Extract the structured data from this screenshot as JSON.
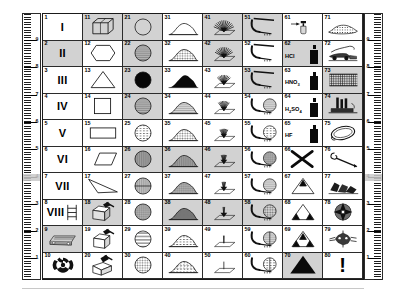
{
  "rulers": {
    "left": {
      "name": "left-ruler",
      "labels": [
        "9",
        "8",
        "7",
        "6",
        "5",
        "4",
        "3",
        "2",
        "1"
      ],
      "highlight_at": "4"
    },
    "right": {
      "name": "right-ruler",
      "labels": [
        "9",
        "8",
        "7",
        "6",
        "5",
        "4",
        "3",
        "2",
        "1"
      ],
      "highlight_at": "4"
    }
  },
  "grid": {
    "columns": 8,
    "rows": 10,
    "cells": [
      {
        "n": "1",
        "shaded": false,
        "icon": "roman-numeral-I",
        "label": "I"
      },
      {
        "n": "2",
        "shaded": true,
        "icon": "roman-numeral-II",
        "label": "II"
      },
      {
        "n": "3",
        "shaded": false,
        "icon": "roman-numeral-III",
        "label": "III"
      },
      {
        "n": "4",
        "shaded": false,
        "icon": "roman-numeral-IV",
        "label": "IV"
      },
      {
        "n": "5",
        "shaded": false,
        "icon": "roman-numeral-V",
        "label": "V"
      },
      {
        "n": "6",
        "shaded": false,
        "icon": "roman-numeral-VI",
        "label": "VI"
      },
      {
        "n": "7",
        "shaded": false,
        "icon": "roman-numeral-VII",
        "label": "VII"
      },
      {
        "n": "8",
        "shaded": false,
        "icon": "roman-numeral-VIII-ladder",
        "label": "VIII"
      },
      {
        "n": "9",
        "shaded": true,
        "icon": "scaffold-beam",
        "label": ""
      },
      {
        "n": "10",
        "shaded": false,
        "icon": "radiation-trefoil",
        "label": ""
      },
      {
        "n": "11",
        "shaded": true,
        "icon": "cube-wireframe",
        "label": ""
      },
      {
        "n": "12",
        "shaded": false,
        "icon": "hexagon-outline",
        "label": ""
      },
      {
        "n": "13",
        "shaded": false,
        "icon": "triangle-outline",
        "label": ""
      },
      {
        "n": "14",
        "shaded": false,
        "icon": "square-outline",
        "label": ""
      },
      {
        "n": "15",
        "shaded": false,
        "icon": "rectangle-outline",
        "label": ""
      },
      {
        "n": "16",
        "shaded": false,
        "icon": "parallelogram-outline",
        "label": ""
      },
      {
        "n": "17",
        "shaded": false,
        "icon": "thin-triangle-outline",
        "label": ""
      },
      {
        "n": "18",
        "shaded": true,
        "icon": "box-hammer-two",
        "label": ""
      },
      {
        "n": "19",
        "shaded": false,
        "icon": "box-hammer-one",
        "label": ""
      },
      {
        "n": "20",
        "shaded": false,
        "icon": "box-hammer-open",
        "label": ""
      },
      {
        "n": "21",
        "shaded": true,
        "icon": "circle-plain",
        "label": ""
      },
      {
        "n": "22",
        "shaded": true,
        "icon": "circle-horizontal-lines",
        "label": ""
      },
      {
        "n": "23",
        "shaded": true,
        "icon": "circle-solid-black",
        "label": ""
      },
      {
        "n": "24",
        "shaded": true,
        "icon": "circle-thin-lines",
        "label": ""
      },
      {
        "n": "25",
        "shaded": false,
        "icon": "circle-dashed-lines",
        "label": ""
      },
      {
        "n": "26",
        "shaded": true,
        "icon": "circle-vertical-lines",
        "label": ""
      },
      {
        "n": "27",
        "shaded": false,
        "icon": "circle-vert-horiz-cross",
        "label": ""
      },
      {
        "n": "28",
        "shaded": false,
        "icon": "circle-fine-grid",
        "label": ""
      },
      {
        "n": "29",
        "shaded": false,
        "icon": "circle-wide-lines",
        "label": ""
      },
      {
        "n": "30",
        "shaded": false,
        "icon": "circle-speckled",
        "label": ""
      },
      {
        "n": "31",
        "shaded": false,
        "icon": "mound-low-outline",
        "label": ""
      },
      {
        "n": "32",
        "shaded": false,
        "icon": "mound-low-shaded",
        "label": ""
      },
      {
        "n": "33",
        "shaded": false,
        "icon": "mound-solid-black",
        "label": ""
      },
      {
        "n": "34",
        "shaded": false,
        "icon": "mound-layered",
        "label": ""
      },
      {
        "n": "35",
        "shaded": false,
        "icon": "mound-speckled",
        "label": ""
      },
      {
        "n": "36",
        "shaded": true,
        "icon": "mound-vertical-hatch",
        "label": ""
      },
      {
        "n": "37",
        "shaded": false,
        "icon": "mound-cross-hatch",
        "label": ""
      },
      {
        "n": "38",
        "shaded": true,
        "icon": "mound-dense-hatch",
        "label": ""
      },
      {
        "n": "39",
        "shaded": false,
        "icon": "mound-contour-lines",
        "label": ""
      },
      {
        "n": "40",
        "shaded": false,
        "icon": "mound-rubble",
        "label": ""
      },
      {
        "n": "41",
        "shaded": true,
        "icon": "spray-fan-wide-filled",
        "label": ""
      },
      {
        "n": "42",
        "shaded": true,
        "icon": "spray-fan-wide",
        "label": ""
      },
      {
        "n": "43",
        "shaded": false,
        "icon": "spray-fan-medium",
        "label": ""
      },
      {
        "n": "44",
        "shaded": false,
        "icon": "spray-fan-narrow",
        "label": ""
      },
      {
        "n": "45",
        "shaded": false,
        "icon": "spray-fan-small",
        "label": ""
      },
      {
        "n": "46",
        "shaded": true,
        "icon": "spray-jet-tight",
        "label": ""
      },
      {
        "n": "47",
        "shaded": false,
        "icon": "spray-jet-few",
        "label": ""
      },
      {
        "n": "48",
        "shaded": true,
        "icon": "spray-jet-single",
        "label": ""
      },
      {
        "n": "49",
        "shaded": false,
        "icon": "spray-drip-pair",
        "label": ""
      },
      {
        "n": "50",
        "shaded": false,
        "icon": "spray-drip-single",
        "label": ""
      },
      {
        "n": "51",
        "shaded": true,
        "icon": "nozzle-flat-jet",
        "label": ""
      },
      {
        "n": "52",
        "shaded": false,
        "icon": "nozzle-flat-jet-2",
        "label": ""
      },
      {
        "n": "53",
        "shaded": true,
        "icon": "nozzle-flat-jet-3",
        "label": ""
      },
      {
        "n": "54",
        "shaded": false,
        "icon": "nozzle-circle-lines",
        "label": ""
      },
      {
        "n": "55",
        "shaded": false,
        "icon": "nozzle-circle-dashed",
        "label": ""
      },
      {
        "n": "56",
        "shaded": false,
        "icon": "nozzle-circle-grid",
        "label": ""
      },
      {
        "n": "57",
        "shaded": false,
        "icon": "nozzle-circle-horiz",
        "label": ""
      },
      {
        "n": "58",
        "shaded": true,
        "icon": "nozzle-circle-speckled",
        "label": ""
      },
      {
        "n": "59",
        "shaded": false,
        "icon": "nozzle-circle-cross",
        "label": ""
      },
      {
        "n": "60",
        "shaded": false,
        "icon": "nozzle-circle-quad",
        "label": ""
      },
      {
        "n": "61",
        "shaded": false,
        "icon": "spray-bottle-arrow",
        "label": ""
      },
      {
        "n": "62",
        "shaded": true,
        "icon": "chemical-bottle",
        "label": "HCl"
      },
      {
        "n": "63",
        "shaded": false,
        "icon": "chemical-bottle",
        "label": "HNO3"
      },
      {
        "n": "64",
        "shaded": false,
        "icon": "chemical-bottle",
        "label": "H2SO4"
      },
      {
        "n": "65",
        "shaded": false,
        "icon": "chemical-bottle",
        "label": "HF"
      },
      {
        "n": "66",
        "shaded": false,
        "icon": "cross-out-x",
        "label": ""
      },
      {
        "n": "67",
        "shaded": false,
        "icon": "triangle-one-small-solid",
        "label": ""
      },
      {
        "n": "68",
        "shaded": false,
        "icon": "triangle-two-solid",
        "label": ""
      },
      {
        "n": "69",
        "shaded": false,
        "icon": "triangle-three-solid",
        "label": ""
      },
      {
        "n": "70",
        "shaded": true,
        "icon": "triangle-large-solid",
        "label": ""
      },
      {
        "n": "71",
        "shaded": false,
        "icon": "gravel-bed",
        "label": ""
      },
      {
        "n": "72",
        "shaded": false,
        "icon": "machine-spreader",
        "label": ""
      },
      {
        "n": "73",
        "shaded": true,
        "icon": "hatched-field",
        "label": ""
      },
      {
        "n": "74",
        "shaded": true,
        "icon": "factory-stacks",
        "label": ""
      },
      {
        "n": "75",
        "shaded": false,
        "icon": "rope-loop",
        "label": ""
      },
      {
        "n": "76",
        "shaded": false,
        "icon": "hook-pole",
        "label": ""
      },
      {
        "n": "77",
        "shaded": false,
        "icon": "rock-fragments",
        "label": ""
      },
      {
        "n": "78",
        "shaded": false,
        "icon": "compass-rose-disc",
        "label": ""
      },
      {
        "n": "79",
        "shaded": false,
        "icon": "splatter-burst",
        "label": ""
      },
      {
        "n": "80",
        "shaded": false,
        "icon": "exclamation-mark",
        "label": "!"
      }
    ]
  }
}
